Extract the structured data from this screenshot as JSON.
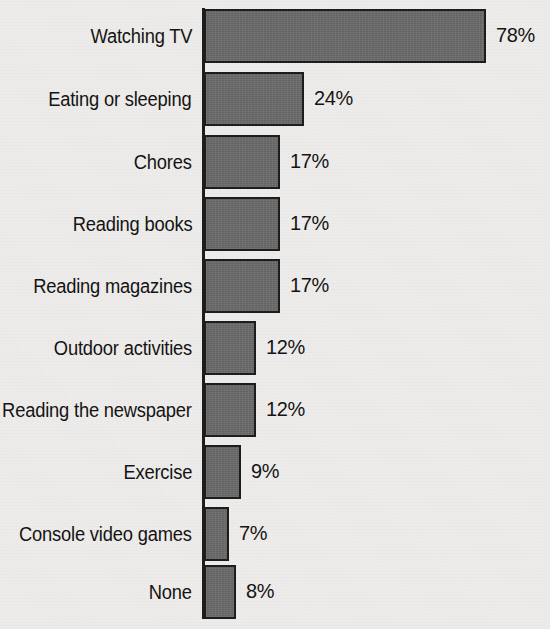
{
  "chart_data": {
    "type": "bar",
    "orientation": "horizontal",
    "title": "",
    "subtitle": "",
    "xlabel": "",
    "ylabel": "",
    "grid": false,
    "legend": null,
    "legend_position": "none",
    "xlim": [
      0,
      78
    ],
    "value_suffix": "%",
    "categories": [
      "Watching TV",
      "Eating or sleeping",
      "Chores",
      "Reading books",
      "Reading magazines",
      "Outdoor activities",
      "Reading the newspaper",
      "Exercise",
      "Console video games",
      "None"
    ],
    "values": [
      78,
      24,
      17,
      17,
      17,
      12,
      12,
      9,
      7,
      8
    ],
    "data_labels": [
      "78%",
      "24%",
      "17%",
      "17%",
      "17%",
      "12%",
      "12%",
      "9%",
      "7%",
      "8%"
    ],
    "bar_pixel_widths": [
      282,
      100,
      76,
      76,
      76,
      52,
      52,
      37,
      25,
      32
    ],
    "colors": {
      "background": "#eeecea",
      "bar_fill": "#6a6a6a",
      "bar_outline": "#1d1d1d",
      "axis": "#1d1d1d",
      "text": "#141414"
    }
  },
  "rows": [
    {
      "label": "Watching TV",
      "value_text": "78%",
      "width_px": 282,
      "top_px": 8
    },
    {
      "label": "Eating or sleeping",
      "value_text": "24%",
      "width_px": 100,
      "top_px": 71
    },
    {
      "label": "Chores",
      "value_text": "17%",
      "width_px": 76,
      "top_px": 134
    },
    {
      "label": "Reading books",
      "value_text": "17%",
      "width_px": 76,
      "top_px": 196
    },
    {
      "label": "Reading magazines",
      "value_text": "17%",
      "width_px": 76,
      "top_px": 258
    },
    {
      "label": "Outdoor activities",
      "value_text": "12%",
      "width_px": 52,
      "top_px": 320
    },
    {
      "label": "Reading the newspaper",
      "value_text": "12%",
      "width_px": 52,
      "top_px": 382
    },
    {
      "label": "Exercise",
      "value_text": "9%",
      "width_px": 37,
      "top_px": 444
    },
    {
      "label": "Console video games",
      "value_text": "7%",
      "width_px": 25,
      "top_px": 506
    },
    {
      "label": "None",
      "value_text": "8%",
      "width_px": 32,
      "top_px": 564
    }
  ]
}
